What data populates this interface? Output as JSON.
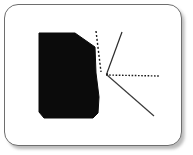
{
  "figure": {
    "type": "diagram",
    "canvas": {
      "width": 193,
      "height": 155,
      "background": "#ffffff"
    },
    "card": {
      "fill": "#ffffff",
      "border_color": "#6e6e6e",
      "border_width": 1,
      "corner_radius": 14,
      "x": 4,
      "y": 4,
      "width": 178,
      "height": 142,
      "shadow": "drop-shadow-bottom-right"
    },
    "shapes": [
      {
        "name": "black-polygon",
        "kind": "polygon",
        "fill": "#0b0b0b",
        "points": "39,33 75,33 95,47 96,73 99,97 98,113 93,118 44,118 39,112"
      }
    ],
    "lines": [
      {
        "name": "vertical-dashed-line",
        "kind": "dashed",
        "color": "#1a1a1a",
        "width": 1.4,
        "dash": "2,2",
        "x1": 96,
        "y1": 31,
        "x2": 101,
        "y2": 72
      },
      {
        "name": "upper-right-diagonal-line",
        "kind": "solid",
        "color": "#2a2a2a",
        "width": 1.2,
        "x1": 122,
        "y1": 32,
        "x2": 107,
        "y2": 73
      },
      {
        "name": "horizontal-dotted-line",
        "kind": "dotted",
        "color": "#1a1a1a",
        "width": 1.4,
        "dash": "1.6,1.6",
        "x1": 106,
        "y1": 75,
        "x2": 159,
        "y2": 76
      },
      {
        "name": "lower-right-diagonal-line",
        "kind": "solid",
        "color": "#3a3a3a",
        "width": 1.2,
        "x1": 107,
        "y1": 75,
        "x2": 154,
        "y2": 116
      }
    ],
    "vertex": {
      "name": "convergence-point",
      "x": 107,
      "y": 74
    },
    "colors": {
      "fill_black": "#0b0b0b",
      "frame": "#6e6e6e",
      "background": "#ffffff",
      "line": "#1a1a1a"
    }
  }
}
